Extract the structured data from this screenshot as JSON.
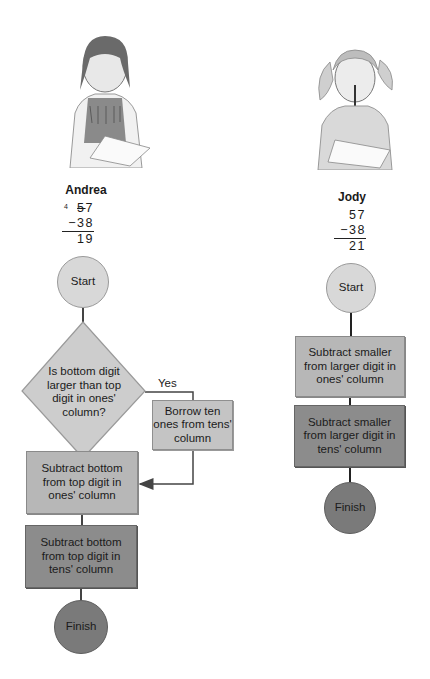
{
  "students": {
    "andrea": {
      "name": "Andrea",
      "problem": {
        "borrow_mark": "4",
        "top": "57",
        "top_tens_crossed": "5",
        "top_ones": "7",
        "bottom": "−38",
        "answer": "19"
      },
      "flowchart": {
        "start": "Start",
        "decision": "Is bottom digit larger than top digit in ones' column?",
        "yes_label": "Yes",
        "borrow": "Borrow ten ones from tens' column",
        "ones_step": "Subtract bottom from top digit in ones' column",
        "tens_step": "Subtract bottom from top digit in tens' column",
        "finish": "Finish"
      }
    },
    "jody": {
      "name": "Jody",
      "problem": {
        "top": "57",
        "bottom": "−38",
        "answer": "21"
      },
      "flowchart": {
        "start": "Start",
        "ones_step": "Subtract smaller from larger digit in ones' column",
        "tens_step": "Subtract smaller from larger digit in tens' column",
        "finish": "Finish"
      }
    }
  },
  "colors": {
    "start_fill": "#d8d8d8",
    "light_box": "#b7b7b7",
    "dark_box": "#8c8c8c",
    "finish_fill": "#7a7a7a",
    "line": "#444444"
  }
}
